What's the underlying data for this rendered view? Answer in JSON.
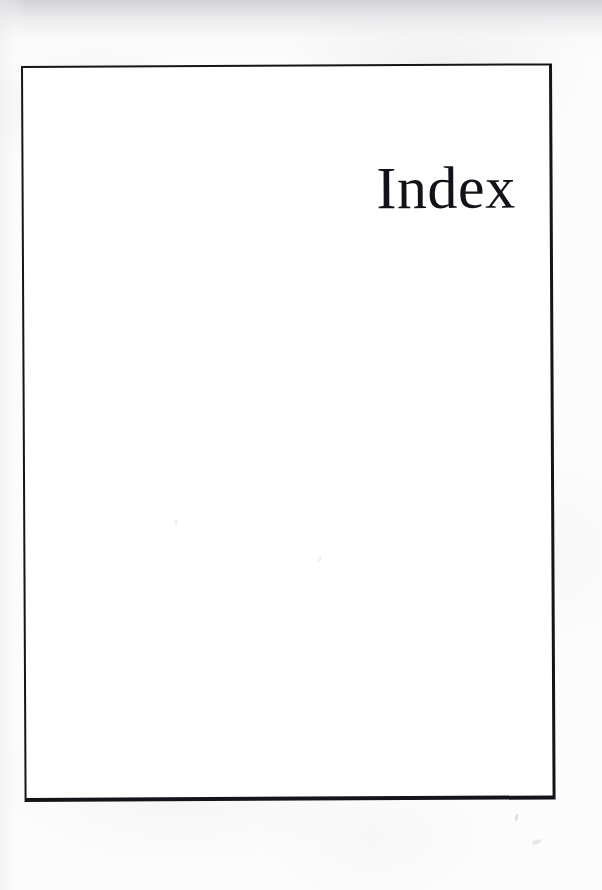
{
  "document": {
    "type": "scanned-book-page",
    "page_background_color": "#fcfcfc",
    "paper_color": "#ffffff"
  },
  "frame": {
    "name": "page-border-rule",
    "border_color": "#14141a",
    "left": 21,
    "top": 66,
    "width": 531,
    "height": 736
  },
  "heading": {
    "text": "Index",
    "alignment": "right",
    "color": "#121218",
    "font_size_px": 60
  },
  "artifacts": {
    "description": "scanner dust specks",
    "color": "#c9c9cd"
  }
}
